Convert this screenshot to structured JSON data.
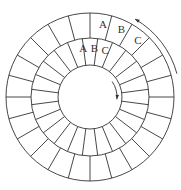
{
  "diagram": {
    "center": [
      90,
      97
    ],
    "radii": {
      "outer": 84,
      "middle": 59,
      "inner": 32
    },
    "outer_ring": {
      "sectors": 24,
      "offset_deg": 0
    },
    "middle_ring": {
      "sectors": 24,
      "offset_deg": 7.5
    },
    "outer_labels": [
      {
        "text": "A",
        "angle_deg": 10
      },
      {
        "text": "B",
        "angle_deg": 25
      },
      {
        "text": "C",
        "angle_deg": 40
      }
    ],
    "middle_labels": [
      {
        "text": "A",
        "angle_deg": -8
      },
      {
        "text": "B",
        "angle_deg": 5
      },
      {
        "text": "C",
        "angle_deg": 18
      }
    ],
    "outer_arrow": {
      "direction": "counterclockwise",
      "from_deg": 75,
      "to_deg": 30,
      "radius": 90
    },
    "inner_arrow": {
      "direction": "clockwise",
      "from_deg": 55,
      "to_deg": 95,
      "radius": 27
    },
    "colors": {
      "stroke": "#333333",
      "background": "#ffffff"
    }
  }
}
